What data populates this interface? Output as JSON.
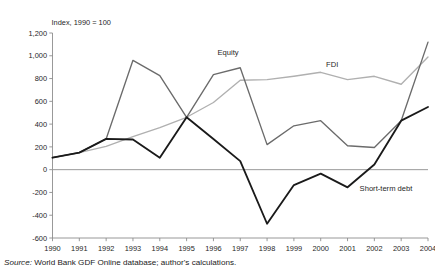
{
  "figure": {
    "axis_caption": "Index, 1990 = 100",
    "source_prefix": "Source:",
    "source_text": " World Bank GDF Online database; author's calculations."
  },
  "chart_data": {
    "type": "line",
    "title": "",
    "subtitle": "",
    "xlabel": "",
    "ylabel": "Index, 1990 = 100",
    "grid": false,
    "legend_position": "inline-annotations",
    "xlim": [
      1990,
      2004
    ],
    "ylim": [
      -600,
      1200
    ],
    "ytick_step": 200,
    "categories": [
      1990,
      1991,
      1992,
      1993,
      1994,
      1995,
      1996,
      1997,
      1998,
      1999,
      2000,
      2001,
      2002,
      2003,
      2004
    ],
    "xtick_labels": [
      "1990",
      "1991",
      "1992",
      "1993",
      "1994",
      "1995",
      "1996",
      "1997",
      "1998",
      "1999",
      "2000",
      "2001",
      "2002",
      "2003",
      "2004"
    ],
    "ytick_labels": [
      "1,200",
      "1,000",
      "800",
      "600",
      "400",
      "200",
      "0",
      "-200",
      "-400",
      "-600"
    ],
    "ytick_values": [
      1200,
      1000,
      800,
      600,
      400,
      200,
      0,
      -200,
      -400,
      -600
    ],
    "series": [
      {
        "name": "Equity",
        "color": "#6b6b6b",
        "label_x": 1996.15,
        "label_y": 1010,
        "values": [
          105,
          150,
          270,
          960,
          825,
          460,
          835,
          895,
          220,
          385,
          430,
          210,
          195,
          430,
          1120
        ]
      },
      {
        "name": "FDI",
        "color": "#b0b0b0",
        "label_x": 2000.2,
        "label_y": 900,
        "values": [
          105,
          150,
          205,
          290,
          370,
          460,
          590,
          785,
          790,
          820,
          855,
          790,
          820,
          750,
          990
        ]
      },
      {
        "name": "Short-term debt",
        "color": "#1a1a1a",
        "label_x": 2001.45,
        "label_y": -185,
        "values": [
          105,
          150,
          270,
          265,
          105,
          460,
          270,
          75,
          -475,
          -135,
          -35,
          -155,
          45,
          430,
          550
        ]
      }
    ]
  }
}
